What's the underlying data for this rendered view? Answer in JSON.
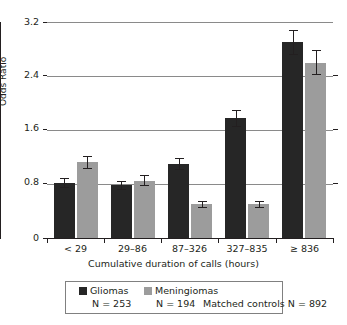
{
  "chart_data": {
    "type": "bar",
    "title": "",
    "xlabel": "Cumulative duration of calls (hours)",
    "ylabel": "Odds Ratio",
    "categories": [
      "< 29",
      "29–86",
      "87–326",
      "327–835",
      "≥ 836"
    ],
    "ylim": [
      0,
      3.2
    ],
    "yticks": [
      0,
      0.8,
      1.6,
      2.4,
      3.2
    ],
    "ytick_labels": [
      "0",
      "0.8",
      "1.6",
      "2.4",
      "3.2"
    ],
    "grid": true,
    "legend_position": "below",
    "series": [
      {
        "name": "Gliomas",
        "color": "#262626",
        "values": [
          0.82,
          0.78,
          1.1,
          1.78,
          2.9
        ],
        "err_low": [
          0.75,
          0.72,
          1.02,
          1.66,
          2.72
        ],
        "err_high": [
          0.89,
          0.85,
          1.18,
          1.9,
          3.08
        ]
      },
      {
        "name": "Meningiomas",
        "color": "#9c9c9c",
        "values": [
          1.12,
          0.85,
          0.5,
          0.5,
          2.6
        ],
        "err_low": [
          1.03,
          0.78,
          0.46,
          0.46,
          2.43
        ],
        "err_high": [
          1.21,
          0.93,
          0.55,
          0.55,
          2.78
        ]
      }
    ]
  },
  "axis": {
    "ylabel": "Odds Ratio",
    "xlabel": "Cumulative duration of calls (hours)",
    "ytick_0": "0",
    "ytick_1": "0.8",
    "ytick_2": "1.6",
    "ytick_3": "2.4",
    "ytick_4": "3.2",
    "xtick_0": "< 29",
    "xtick_1": "29–86",
    "xtick_2": "87–326",
    "xtick_3": "327–835",
    "xtick_4": "≥ 836"
  },
  "legend": {
    "gliomas_label": "Gliomas",
    "meningiomas_label": "Meningiomas",
    "gliomas_n": "N = 253",
    "meningiomas_n": "N = 194",
    "controls_n": "Matched controls N = 892"
  },
  "colors": {
    "gliomas": "#262626",
    "meningiomas": "#9c9c9c",
    "axis": "#231f20",
    "grid": "#8a8a8a",
    "background": "#ffffff"
  }
}
